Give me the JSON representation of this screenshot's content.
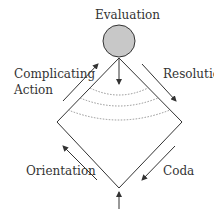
{
  "diagram": {
    "type": "narrative-structure",
    "labels": {
      "evaluation": "Evaluation",
      "complicating_action_line1": "Complicating",
      "complicating_action_line2": "Action",
      "resolution": "Resolution",
      "orientation": "Orientation",
      "coda": "Coda"
    },
    "colors": {
      "line": "#333333",
      "circle_fill": "#c8c8c8",
      "dotted": "#888888"
    }
  }
}
